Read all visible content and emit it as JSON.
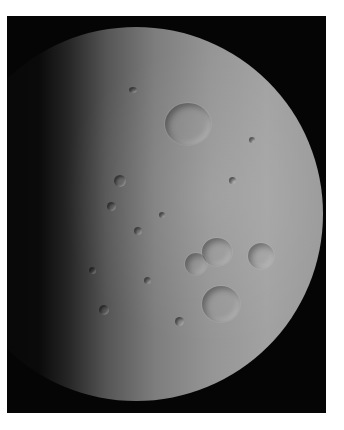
{
  "image": {
    "subject": "Cratered icy moon, half-illuminated from the right",
    "background": "black space with white border",
    "colors": {
      "border": "#ffffff",
      "space": "#050505",
      "surface_lit": "#a2a2a2",
      "surface_dark": "#262626"
    }
  }
}
